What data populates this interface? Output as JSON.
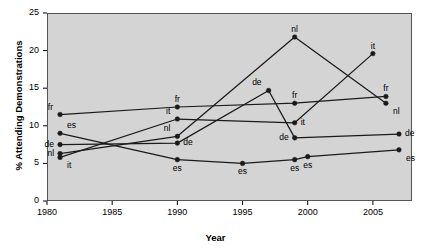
{
  "chart_data": {
    "type": "line",
    "title": "",
    "xlabel": "Year",
    "ylabel": "% Attending Demonstrations",
    "xlim": [
      1980,
      2008
    ],
    "ylim": [
      0,
      25
    ],
    "xticks": [
      1980,
      1985,
      1990,
      1995,
      2000,
      2005
    ],
    "yticks": [
      0,
      5,
      10,
      15,
      20,
      25
    ],
    "grid": false,
    "legend": "none (inline point labels)",
    "marker": "filled-circle",
    "line_color": "#1a1a1a",
    "plot_background": "#d4d4d4",
    "series": [
      {
        "name": "fr",
        "label": "fr",
        "x": [
          1981,
          1990,
          1999,
          2006
        ],
        "values": [
          11.5,
          12.5,
          13.0,
          13.9
        ],
        "point_labels": [
          "fr",
          "fr",
          "fr",
          "fr"
        ],
        "label_positions": [
          "above-left",
          "above",
          "above",
          "above"
        ]
      },
      {
        "name": "es",
        "label": "es",
        "x": [
          1981,
          1990,
          1995,
          1999,
          2000,
          2007
        ],
        "values": [
          9.0,
          5.5,
          5.0,
          5.5,
          5.9,
          6.8
        ],
        "point_labels": [
          "es",
          "es",
          "es",
          "es",
          "es",
          "es"
        ],
        "label_positions": [
          "above-right",
          "below",
          "below",
          "below",
          "below",
          "below-right"
        ]
      },
      {
        "name": "de",
        "label": "de",
        "x": [
          1981,
          1990,
          1997,
          1999,
          2007
        ],
        "values": [
          7.5,
          7.7,
          14.7,
          8.4,
          8.9
        ],
        "point_labels": [
          "de",
          "de",
          "de",
          "de",
          "de"
        ],
        "label_positions": [
          "left",
          "right",
          "above-left",
          "left",
          "right"
        ]
      },
      {
        "name": "nl",
        "label": "nl",
        "x": [
          1981,
          1990,
          1999,
          2006
        ],
        "values": [
          6.3,
          8.6,
          21.8,
          13.0
        ],
        "point_labels": [
          "nl",
          "nl",
          "nl",
          "nl"
        ],
        "label_positions": [
          "left",
          "above-left",
          "above",
          "below-right"
        ]
      },
      {
        "name": "it",
        "label": "it",
        "x": [
          1981,
          1990,
          1999,
          2005
        ],
        "values": [
          5.8,
          10.9,
          10.4,
          19.6
        ],
        "point_labels": [
          "it",
          "it",
          "it",
          "it"
        ],
        "label_positions": [
          "below-right",
          "above-left",
          "right",
          "above"
        ]
      }
    ]
  }
}
